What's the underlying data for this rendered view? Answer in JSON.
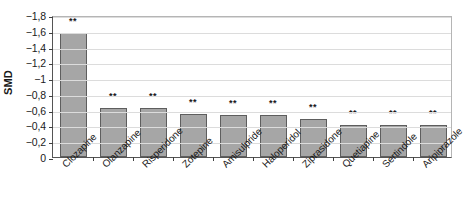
{
  "chart_data": {
    "type": "bar",
    "title": "",
    "xlabel": "",
    "ylabel": "SMD",
    "ylim": [
      0,
      -1.8
    ],
    "y_ticks": [
      "0",
      "−0,2",
      "−0,4",
      "−0,6",
      "−0,8",
      "−1",
      "−1,2",
      "−1,4",
      "−1,6",
      "−1,8"
    ],
    "y_tick_values": [
      0,
      -0.2,
      -0.4,
      -0.6,
      -0.8,
      -1,
      -1.2,
      -1.4,
      -1.6,
      -1.8
    ],
    "grid": true,
    "legend": "none",
    "axis_inverted": true,
    "categories": [
      "Clozapine",
      "Olanzapine",
      "Risperidone",
      "Zotepine",
      "Amisulpride",
      "Haloperidol",
      "Ziprasidone",
      "Quetiapine",
      "Sertindole",
      "Aripiprazole"
    ],
    "values": [
      -1.57,
      -0.62,
      -0.62,
      -0.55,
      -0.53,
      -0.53,
      -0.48,
      -0.41,
      -0.41,
      -0.41
    ],
    "annotations": [
      "**",
      "**",
      "**",
      "**",
      "**",
      "**",
      "**",
      "**",
      "**",
      "**"
    ],
    "series": [
      {
        "name": "SMD",
        "values": [
          -1.57,
          -0.62,
          -0.62,
          -0.55,
          -0.53,
          -0.53,
          -0.48,
          -0.41,
          -0.41,
          -0.41
        ]
      }
    ],
    "colors": {
      "bar_fill": "#a6a6a6",
      "bar_stroke": "#5e5e5e",
      "gridline": "#dcdcdc",
      "axis": "#555555",
      "text": "#1a1a1a",
      "background": "#ffffff"
    }
  }
}
